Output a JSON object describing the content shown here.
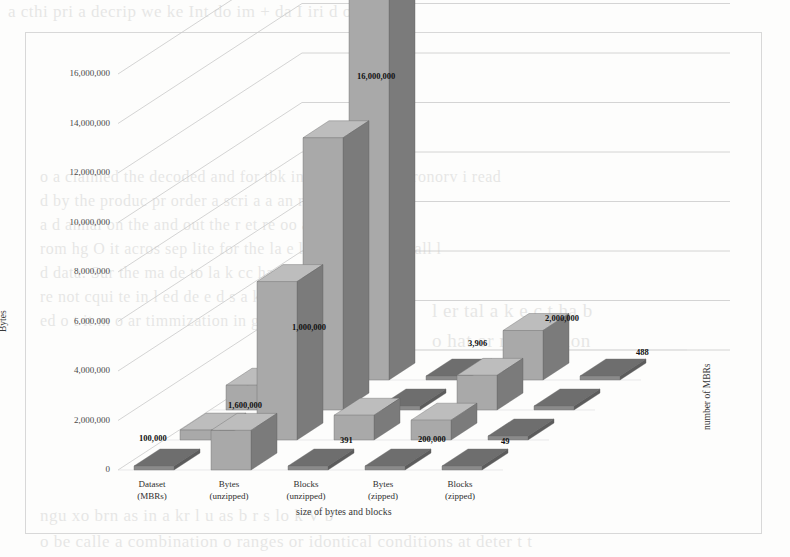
{
  "chart_data": {
    "type": "bar",
    "render": "3d-bar",
    "title": "",
    "xlabel": "size of bytes and blocks",
    "ylabel": "Bytes",
    "zlabel": "number of MBRs",
    "categories": [
      "Dataset\n(MBRs)",
      "Bytes\n(unzipped)",
      "Blocks\n(unzipped)",
      "Bytes\n(zipped)",
      "Blocks\n(zipped)"
    ],
    "category_lines": [
      [
        "Dataset",
        "(MBRs)"
      ],
      [
        "Bytes",
        "(unzipped)"
      ],
      [
        "Blocks",
        "(unzipped)"
      ],
      [
        "Bytes",
        "(zipped)"
      ],
      [
        "Blocks",
        "(zipped)"
      ]
    ],
    "ylim": [
      0,
      16000000
    ],
    "ytick_step": 2000000,
    "yticks": [
      "0",
      "2,000,000",
      "4,000,000",
      "6,000,000",
      "8,000,000",
      "10,000,000",
      "12,000,000",
      "14,000,000",
      "16,000,000"
    ],
    "ytick_values": [
      0,
      2000000,
      4000000,
      6000000,
      8000000,
      10000000,
      12000000,
      14000000,
      16000000
    ],
    "grid": true,
    "legend": false,
    "depth_rows": 4,
    "series": [
      {
        "name": "row-1",
        "values": [
          100000,
          1600000,
          391,
          200000,
          49
        ]
      },
      {
        "name": "row-2",
        "values": [
          400000,
          6400000,
          1000000,
          800000,
          3906
        ]
      },
      {
        "name": "row-3",
        "values": [
          1000000,
          11000000,
          3906,
          1400000,
          200000
        ]
      },
      {
        "name": "row-4",
        "values": [
          1600000,
          16000000,
          200000,
          2000000,
          488
        ]
      }
    ],
    "data_labels": [
      {
        "text": "100,000",
        "x": 139,
        "y": 433
      },
      {
        "text": "1,600,000",
        "x": 228,
        "y": 400
      },
      {
        "text": "1,000,000",
        "x": 292,
        "y": 322
      },
      {
        "text": "16,000,000",
        "x": 357,
        "y": 71
      },
      {
        "text": "391",
        "x": 340,
        "y": 435
      },
      {
        "text": "200,000",
        "x": 418,
        "y": 434
      },
      {
        "text": "3,906",
        "x": 468,
        "y": 338
      },
      {
        "text": "2,000,000",
        "x": 545,
        "y": 313
      },
      {
        "text": "49",
        "x": 501,
        "y": 436
      },
      {
        "text": "488",
        "x": 636,
        "y": 347
      }
    ]
  },
  "background_text": {
    "top": "a  cthi  pri  a  decrip   we  ke  Int   do  im +   da  I   iri  d  or  lc pg l",
    "b1": "o a claimed the decoded and for tbk indica quotinq    in  ronorv i read",
    "b2": "d by  the produc pr order a scri  a  a  an  r  i  sly  the  vaid",
    "b3": "a  d  annal  on  the  and  out  the  r  et  re  oo  a  he  yes  n",
    "b4": "rom hg O it acros sep lite for the la    e  la  d  t  hpo    to a    Teall  l",
    "b5": "d data. Sur the  ma de to    la k   cc   ha  n  s    n  s equirem  eto",
    "b6": "re not cqui te in    l  ed  de  e  d  s  a  k  a  i  s  s  s  b",
    "b7": "ed  o  t  it m  o  ar  timmization   in  g",
    "r1": "l  er  tal  a  k  e  c  t  ha  b",
    "r2": "o  hat  or  mimization",
    "bot1": "ngu  xo  brn  as  in  a   kr   l  u  as  b  r  s  lo   k  V  b",
    "bot2": "o be calle  a  combination  o  ranges  or  idontical  conditions  at  deter   t  t"
  }
}
